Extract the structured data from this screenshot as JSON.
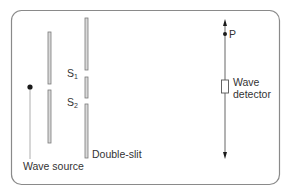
{
  "diagram": {
    "colors": {
      "border": "#8a8a8a",
      "barrier_fill": "#d9d9d9",
      "barrier_stroke": "#7a7a7a",
      "line": "#555555",
      "dot": "#1a1a1a",
      "text": "#333333"
    },
    "labels": {
      "wave_source": "Wave source",
      "double_slit": "Double-slit",
      "slit1_main": "S",
      "slit1_sub": "1",
      "slit2_main": "S",
      "slit2_sub": "2",
      "point_p": "P",
      "detector_line1": "Wave",
      "detector_line2": "detector"
    },
    "components": [
      {
        "name": "wave-source",
        "type": "point",
        "label": "Wave source"
      },
      {
        "name": "first-barrier",
        "type": "barrier",
        "segments": 2
      },
      {
        "name": "double-slit",
        "type": "barrier",
        "slits": [
          "S1",
          "S2"
        ]
      },
      {
        "name": "detector-track",
        "type": "double-arrow",
        "point": "P"
      },
      {
        "name": "wave-detector",
        "type": "box",
        "label": "Wave detector"
      }
    ]
  }
}
